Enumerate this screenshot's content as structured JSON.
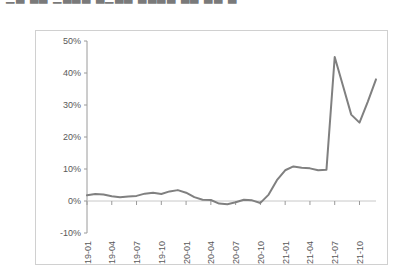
{
  "page": {
    "cut_off_header_text": "▁▃ ▃▃ ▁▃▃▃ ▃▁▃▃  ▃▃▃▃  ▃▃ ▃▃   ▃",
    "background_color": "#ffffff",
    "frame_border_color": "#d0d0d0"
  },
  "chart_data": {
    "type": "line",
    "title": "",
    "subtitle": "",
    "xlabel": "",
    "ylabel": "",
    "ylim": [
      -10,
      50
    ],
    "yticks": [
      -10,
      0,
      10,
      20,
      30,
      40,
      50
    ],
    "ytick_labels": [
      "-10%",
      "0%",
      "10%",
      "20%",
      "30%",
      "40%",
      "50%"
    ],
    "grid": false,
    "legend": false,
    "legend_position": "none",
    "line_color": "#808080",
    "line_width": 2,
    "axis_color": "#9a9a9a",
    "xtick_labels": [
      "2019-01",
      "2019-04",
      "2019-07",
      "2019-10",
      "2020-01",
      "2020-04",
      "2020-07",
      "2020-10",
      "2021-01",
      "2021-04",
      "2021-07",
      "2021-10"
    ],
    "x": [
      "2019-01",
      "2019-02",
      "2019-03",
      "2019-04",
      "2019-05",
      "2019-06",
      "2019-07",
      "2019-08",
      "2019-09",
      "2019-10",
      "2019-11",
      "2019-12",
      "2020-01",
      "2020-02",
      "2020-03",
      "2020-04",
      "2020-05",
      "2020-06",
      "2020-07",
      "2020-08",
      "2020-09",
      "2020-10",
      "2020-11",
      "2020-12",
      "2021-01",
      "2021-02",
      "2021-03",
      "2021-04",
      "2021-05",
      "2021-06",
      "2021-07",
      "2021-08",
      "2021-09",
      "2021-10",
      "2021-11",
      "2021-12"
    ],
    "series": [
      {
        "name": "value",
        "values": [
          1.8,
          2.2,
          2.0,
          1.5,
          1.2,
          1.4,
          1.6,
          2.3,
          2.6,
          2.2,
          3.0,
          3.4,
          2.6,
          1.2,
          0.4,
          0.3,
          -0.8,
          -1.0,
          -0.4,
          0.4,
          0.2,
          -0.6,
          2.0,
          6.5,
          9.6,
          10.8,
          10.4,
          10.2,
          9.6,
          9.8,
          45.0,
          36.0,
          27.0,
          24.5,
          31.0,
          38.0
        ]
      }
    ]
  }
}
